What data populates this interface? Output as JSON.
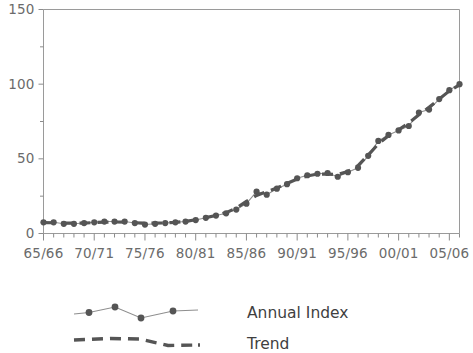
{
  "chart_data": {
    "type": "line",
    "title": "",
    "subtitle": "",
    "xlabel": "",
    "ylabel": "",
    "xlim": [
      1965,
      2006
    ],
    "ylim": [
      0,
      150
    ],
    "grid": false,
    "legend_position": "bottom",
    "y_ticks": [
      0,
      50,
      100,
      150
    ],
    "y_tick_labels": [
      "0",
      "50",
      "100",
      "150"
    ],
    "y_minor_ticks": [
      25,
      75,
      125
    ],
    "x_tick_labels": [
      "65/66",
      "70/71",
      "75/76",
      "80/81",
      "85/86",
      "90/91",
      "95/96",
      "00/01",
      "05/06"
    ],
    "x_tick_years": [
      1965,
      1970,
      1975,
      1980,
      1985,
      1990,
      1995,
      2000,
      2005
    ],
    "x": [
      1965,
      1966,
      1967,
      1968,
      1969,
      1970,
      1971,
      1972,
      1973,
      1974,
      1975,
      1976,
      1977,
      1978,
      1979,
      1980,
      1981,
      1982,
      1983,
      1984,
      1985,
      1986,
      1987,
      1988,
      1989,
      1990,
      1991,
      1992,
      1993,
      1994,
      1995,
      1996,
      1997,
      1998,
      1999,
      2000,
      2001,
      2002,
      2003,
      2004,
      2005,
      2006
    ],
    "series": [
      {
        "name": "Annual Index",
        "marker": "circle",
        "style": "solid-thin",
        "values": [
          7.5,
          7.5,
          6.5,
          6.5,
          7.0,
          7.5,
          8.0,
          8.0,
          8.0,
          7.0,
          6.0,
          6.5,
          7.0,
          7.5,
          8.0,
          9.0,
          10.5,
          12.0,
          13.5,
          16.0,
          20.0,
          28.0,
          26.0,
          30.0,
          33.0,
          37.0,
          39.0,
          40.0,
          40.5,
          38.0,
          41.0,
          44.0,
          52.0,
          62.0,
          66.0,
          69.0,
          72.0,
          81.0,
          83.0,
          90.0,
          96.0,
          100.0
        ]
      },
      {
        "name": "Trend",
        "marker": "none",
        "style": "dashed-thick",
        "values": [
          7.3,
          7.2,
          7.0,
          6.9,
          7.0,
          7.3,
          7.6,
          7.7,
          7.6,
          7.2,
          6.9,
          6.9,
          7.1,
          7.5,
          8.1,
          9.2,
          10.6,
          12.1,
          14.0,
          17.0,
          21.5,
          25.5,
          28.0,
          30.5,
          33.5,
          36.5,
          38.5,
          39.8,
          39.8,
          39.5,
          41.5,
          45.5,
          52.5,
          60.0,
          65.5,
          69.5,
          74.0,
          79.5,
          84.5,
          90.0,
          95.5,
          99.5
        ]
      }
    ]
  },
  "legend": {
    "entries": [
      {
        "label": "Annual Index",
        "style": "line-with-markers"
      },
      {
        "label": "Trend",
        "style": "thick-dashed"
      }
    ]
  },
  "colors": {
    "series_line": "#8e8e8e",
    "marker": "#555555",
    "trend": "#555555",
    "axis": "#9a9a9a",
    "tick_label": "#6b6b6b",
    "legend_label": "#3f3f3f",
    "background": "#ffffff"
  }
}
